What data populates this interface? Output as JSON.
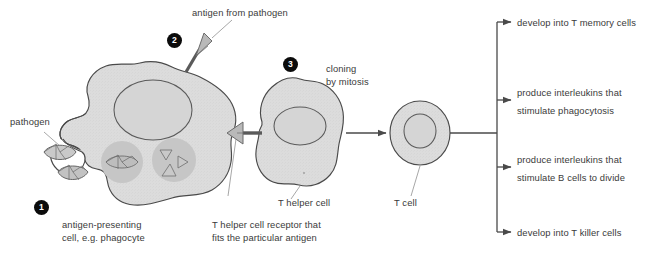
{
  "diagram": {
    "background_color": "#ffffff",
    "line_color": "#4a4a4a",
    "cell_fill": "#dcdcdc",
    "vesicle_fill": "#c6c6c6",
    "marker_color": "#0b0b0b",
    "text_color": "#3a3a3a"
  },
  "markers": [
    {
      "id": "marker-1",
      "label": "1"
    },
    {
      "id": "marker-2",
      "label": "2"
    },
    {
      "id": "marker-3",
      "label": "3"
    }
  ],
  "labels": {
    "pathogen": "pathogen",
    "antigen_from_pathogen": "antigen from pathogen",
    "antigen_presenting_cell_line1": "antigen-presenting",
    "antigen_presenting_cell_line2": "cell, e.g. phagocyte",
    "cloning_line1": "cloning",
    "cloning_line2": "by mitosis",
    "t_helper_cell": "T helper cell",
    "receptor_line1": "T helper cell receptor that",
    "receptor_line2": "fits the particular antigen",
    "t_cell": "T cell"
  },
  "outcomes": [
    {
      "id": "outcome-memory",
      "line1": "develop into T memory cells",
      "line2": ""
    },
    {
      "id": "outcome-phagocytosis",
      "line1": "produce interleukins that",
      "line2": "stimulate phagocytosis"
    },
    {
      "id": "outcome-b-cells",
      "line1": "produce interleukins that",
      "line2": "stimulate B cells to divide"
    },
    {
      "id": "outcome-killer",
      "line1": "develop into T killer cells",
      "line2": ""
    }
  ]
}
